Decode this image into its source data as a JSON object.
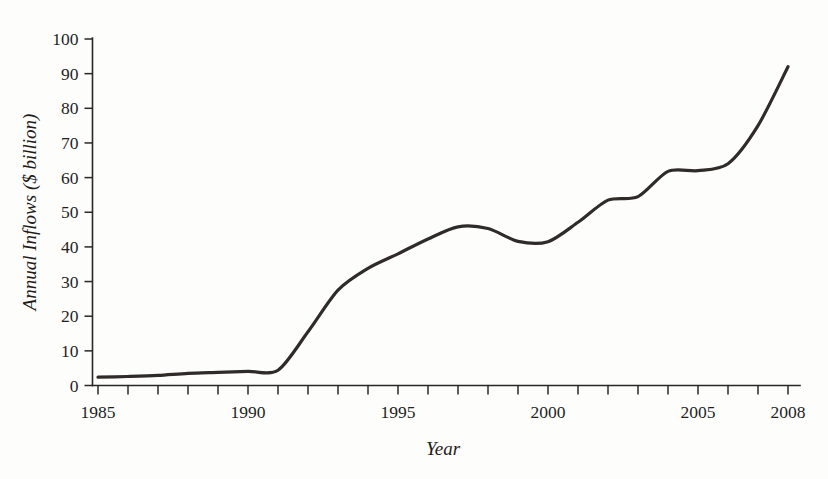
{
  "chart_data": {
    "type": "line",
    "title": "",
    "xlabel": "Year",
    "ylabel": "Annual Inflows ($ billion)",
    "xlim": [
      1985,
      2008
    ],
    "ylim": [
      0,
      100
    ],
    "grid": false,
    "legend": null,
    "x_tick_labels": [
      "1985",
      "1990",
      "1995",
      "2000",
      "2005",
      "2008"
    ],
    "x_tick_values": [
      1985,
      1990,
      1995,
      2000,
      2005,
      2008
    ],
    "x_minor_ticks": [
      1985,
      1986,
      1987,
      1988,
      1989,
      1990,
      1991,
      1992,
      1993,
      1994,
      1995,
      1996,
      1997,
      1998,
      1999,
      2000,
      2001,
      2002,
      2003,
      2004,
      2005,
      2006,
      2007,
      2008
    ],
    "y_tick_labels": [
      "0",
      "10",
      "20",
      "30",
      "40",
      "50",
      "60",
      "70",
      "80",
      "90",
      "100"
    ],
    "y_tick_values": [
      0,
      10,
      20,
      30,
      40,
      50,
      60,
      70,
      80,
      90,
      100
    ],
    "line_color": "#2e2b28",
    "x": [
      1985,
      1986,
      1987,
      1988,
      1989,
      1990,
      1991,
      1992,
      1993,
      1994,
      1995,
      1996,
      1997,
      1998,
      1999,
      2000,
      2001,
      2002,
      2003,
      2004,
      2005,
      2006,
      2007,
      2008
    ],
    "values": [
      2.4,
      2.6,
      2.9,
      3.5,
      3.8,
      4.1,
      4.4,
      15.5,
      27.5,
      33.8,
      38.0,
      42.3,
      45.8,
      45.3,
      41.6,
      41.5,
      47.1,
      53.5,
      54.5,
      61.8,
      62.0,
      64.0,
      75.0,
      92.0
    ],
    "series_name": "Annual Inflows"
  },
  "bleed_text": {
    "line_one": "",
    "line_two": ""
  }
}
